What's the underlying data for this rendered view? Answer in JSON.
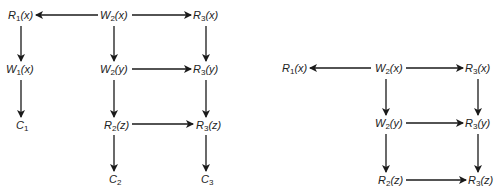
{
  "colors": {
    "ink": "#1a1a1a",
    "background": "#ffffff"
  },
  "graphs": [
    {
      "name": "left-graph",
      "nodes": [
        {
          "id": "L_R1x",
          "base": "R",
          "sub": "1",
          "arg": "(x)",
          "x": 8,
          "y": 9
        },
        {
          "id": "L_W2x",
          "base": "W",
          "sub": "2",
          "arg": "(x)",
          "x": 100,
          "y": 9
        },
        {
          "id": "L_R3x",
          "base": "R",
          "sub": "3",
          "arg": "(x)",
          "x": 193,
          "y": 9
        },
        {
          "id": "L_W1x",
          "base": "W",
          "sub": "1",
          "arg": "(x)",
          "x": 6,
          "y": 63
        },
        {
          "id": "L_W2y",
          "base": "W",
          "sub": "2",
          "arg": "(y)",
          "x": 100,
          "y": 63
        },
        {
          "id": "L_R3y",
          "base": "R",
          "sub": "3",
          "arg": "(y)",
          "x": 193,
          "y": 63
        },
        {
          "id": "L_C1",
          "base": "C",
          "sub": "1",
          "arg": "",
          "x": 16,
          "y": 119
        },
        {
          "id": "L_R2z",
          "base": "R",
          "sub": "2",
          "arg": "(z)",
          "x": 104,
          "y": 119
        },
        {
          "id": "L_R3z",
          "base": "R",
          "sub": "3",
          "arg": "(z)",
          "x": 196,
          "y": 119
        },
        {
          "id": "L_C2",
          "base": "C",
          "sub": "2",
          "arg": "",
          "x": 109,
          "y": 173
        },
        {
          "id": "L_C3",
          "base": "C",
          "sub": "3",
          "arg": "",
          "x": 201,
          "y": 173
        }
      ],
      "edges": [
        {
          "from": "L_W2x",
          "to": "L_R1x",
          "x1": 98,
          "y1": 15,
          "x2": 36,
          "y2": 15
        },
        {
          "from": "L_W2x",
          "to": "L_R3x",
          "x1": 132,
          "y1": 15,
          "x2": 191,
          "y2": 15
        },
        {
          "from": "L_R1x",
          "to": "L_W1x",
          "x1": 21,
          "y1": 26,
          "x2": 21,
          "y2": 61
        },
        {
          "from": "L_W2x",
          "to": "L_W2y",
          "x1": 114,
          "y1": 26,
          "x2": 114,
          "y2": 61
        },
        {
          "from": "L_R3x",
          "to": "L_R3y",
          "x1": 206,
          "y1": 26,
          "x2": 206,
          "y2": 61
        },
        {
          "from": "L_W2y",
          "to": "L_R3y",
          "x1": 132,
          "y1": 69,
          "x2": 191,
          "y2": 69
        },
        {
          "from": "L_W1x",
          "to": "L_C1",
          "x1": 21,
          "y1": 80,
          "x2": 21,
          "y2": 117
        },
        {
          "from": "L_W2y",
          "to": "L_R2z",
          "x1": 114,
          "y1": 80,
          "x2": 114,
          "y2": 117
        },
        {
          "from": "L_R3y",
          "to": "L_R3z",
          "x1": 206,
          "y1": 80,
          "x2": 206,
          "y2": 117
        },
        {
          "from": "L_R2z",
          "to": "L_R3z",
          "x1": 132,
          "y1": 124,
          "x2": 193,
          "y2": 124
        },
        {
          "from": "L_R2z",
          "to": "L_C2",
          "x1": 114,
          "y1": 135,
          "x2": 114,
          "y2": 171
        },
        {
          "from": "L_R3z",
          "to": "L_C3",
          "x1": 206,
          "y1": 135,
          "x2": 206,
          "y2": 171
        }
      ]
    },
    {
      "name": "right-graph",
      "nodes": [
        {
          "id": "R_R1x",
          "base": "R",
          "sub": "1",
          "arg": "(x)",
          "x": 282,
          "y": 62
        },
        {
          "id": "R_W2x",
          "base": "W",
          "sub": "2",
          "arg": "(x)",
          "x": 375,
          "y": 62
        },
        {
          "id": "R_R3x",
          "base": "R",
          "sub": "3",
          "arg": "(x)",
          "x": 465,
          "y": 62
        },
        {
          "id": "R_W2y",
          "base": "W",
          "sub": "2",
          "arg": "(y)",
          "x": 375,
          "y": 117
        },
        {
          "id": "R_R3y",
          "base": "R",
          "sub": "3",
          "arg": "(y)",
          "x": 465,
          "y": 117
        },
        {
          "id": "R_R2z",
          "base": "R",
          "sub": "2",
          "arg": "(z)",
          "x": 378,
          "y": 174
        },
        {
          "id": "R_R3z",
          "base": "R",
          "sub": "3",
          "arg": "(z)",
          "x": 468,
          "y": 174
        }
      ],
      "edges": [
        {
          "from": "R_W2x",
          "to": "R_R1x",
          "x1": 371,
          "y1": 68,
          "x2": 310,
          "y2": 68
        },
        {
          "from": "R_W2x",
          "to": "R_R3x",
          "x1": 406,
          "y1": 68,
          "x2": 463,
          "y2": 68
        },
        {
          "from": "R_W2x",
          "to": "R_W2y",
          "x1": 386,
          "y1": 79,
          "x2": 386,
          "y2": 115
        },
        {
          "from": "R_R3x",
          "to": "R_R3y",
          "x1": 478,
          "y1": 79,
          "x2": 478,
          "y2": 115
        },
        {
          "from": "R_W2y",
          "to": "R_R3y",
          "x1": 406,
          "y1": 123,
          "x2": 463,
          "y2": 123
        },
        {
          "from": "R_W2y",
          "to": "R_R2z",
          "x1": 386,
          "y1": 134,
          "x2": 386,
          "y2": 172
        },
        {
          "from": "R_R3y",
          "to": "R_R3z",
          "x1": 478,
          "y1": 134,
          "x2": 478,
          "y2": 172
        },
        {
          "from": "R_R2z",
          "to": "R_R3z",
          "x1": 406,
          "y1": 180,
          "x2": 466,
          "y2": 180
        }
      ]
    }
  ]
}
